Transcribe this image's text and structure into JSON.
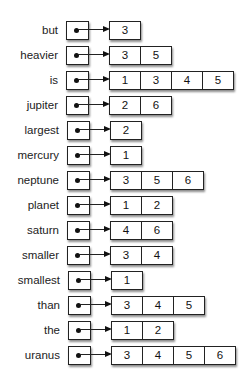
{
  "diagram": {
    "type": "dictionary-of-lists",
    "rows": [
      {
        "key": "but",
        "values": [
          "3"
        ]
      },
      {
        "key": "heavier",
        "values": [
          "3",
          "5"
        ]
      },
      {
        "key": "is",
        "values": [
          "1",
          "3",
          "4",
          "5"
        ]
      },
      {
        "key": "jupiter",
        "values": [
          "2",
          "6"
        ]
      },
      {
        "key": "largest",
        "values": [
          "2"
        ]
      },
      {
        "key": "mercury",
        "values": [
          "1"
        ]
      },
      {
        "key": "neptune",
        "values": [
          "3",
          "5",
          "6"
        ]
      },
      {
        "key": "planet",
        "values": [
          "1",
          "2"
        ]
      },
      {
        "key": "saturn",
        "values": [
          "4",
          "6"
        ]
      },
      {
        "key": "smaller",
        "values": [
          "3",
          "4"
        ]
      },
      {
        "key": "smallest",
        "values": [
          "1"
        ]
      },
      {
        "key": "than",
        "values": [
          "3",
          "4",
          "5"
        ]
      },
      {
        "key": "the",
        "values": [
          "1",
          "2"
        ]
      },
      {
        "key": "uranus",
        "values": [
          "3",
          "4",
          "5",
          "6"
        ]
      }
    ]
  }
}
